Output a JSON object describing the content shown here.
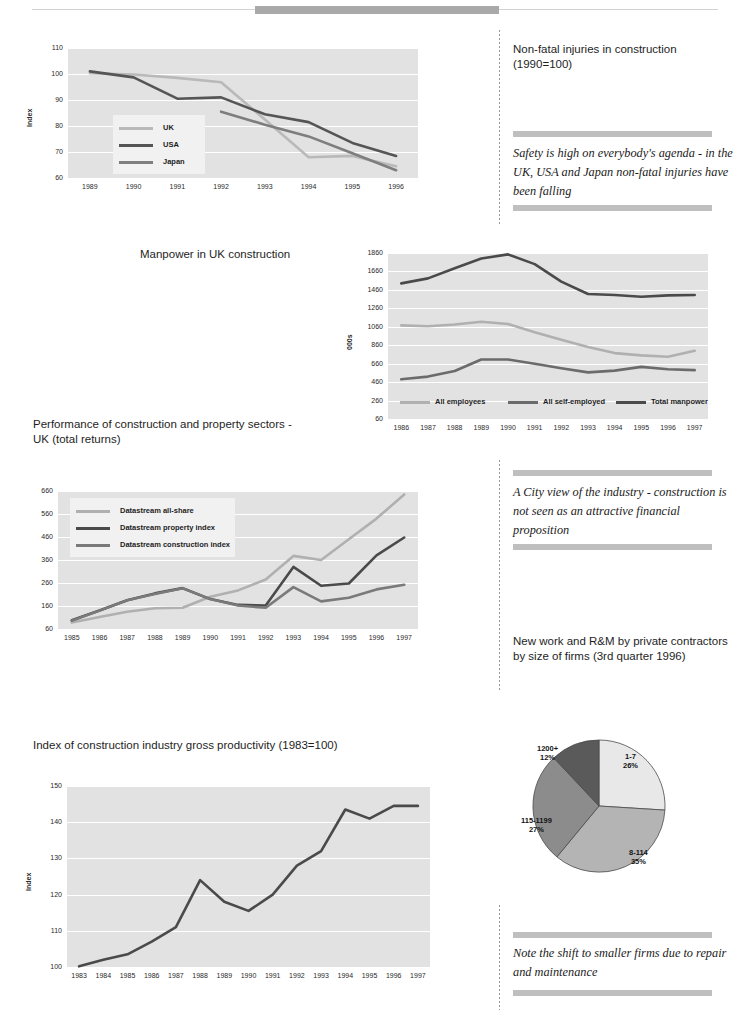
{
  "top_bar": {
    "accent_color": "#a9a9a9",
    "rule_color": "#d3d3d3"
  },
  "palette": {
    "light": "#b9b9b9",
    "mid": "#8c8c8c",
    "dark": "#555555",
    "darkest": "#3f3f3f",
    "plot_bg": "#e2e2e2",
    "bar_gray": "#bfbfbf"
  },
  "sidebar": {
    "block1": {
      "title": "Non-fatal injuries in construction (1990=100)",
      "quote": "Safety is high on everybody's agenda - in the UK, USA and Japan non-fatal injuries have been falling"
    },
    "block2": {
      "quote": "A City view of the industry - construction is not seen as an attractive financial proposition",
      "title": "New work and R&M by private contractors by size of firms (3rd quarter 1996)"
    },
    "block3": {
      "quote": "Note the shift to smaller firms due to repair and maintenance"
    }
  },
  "titles": {
    "manpower": "Manpower in UK construction",
    "performance": "Performance of construction and property sectors - UK (total returns)",
    "productivity": "Index of construction industry gross productivity (1983=100)"
  },
  "chart_data": [
    {
      "id": "injuries",
      "type": "line",
      "title": "Non-fatal injuries in construction (1990=100)",
      "xlabel": "",
      "ylabel": "Index",
      "x": [
        "1989",
        "1990",
        "1991",
        "1992",
        "1993",
        "1994",
        "1995",
        "1996"
      ],
      "ylim": [
        60,
        110
      ],
      "yticks": [
        60,
        70,
        80,
        90,
        100,
        110
      ],
      "grid": true,
      "legend": "inside-left",
      "series": [
        {
          "name": "UK",
          "color": "#b9b9b9",
          "values": [
            100.3,
            99.8,
            98.5,
            96.8,
            82.5,
            68.0,
            68.5,
            64.5
          ]
        },
        {
          "name": "USA",
          "color": "#555555",
          "values": [
            101.0,
            98.7,
            90.5,
            91.0,
            84.5,
            81.5,
            73.5,
            68.5
          ]
        },
        {
          "name": "Japan",
          "color": "#7e7e7e",
          "values": [
            null,
            null,
            null,
            85.5,
            80.5,
            76.0,
            69.5,
            63.0
          ]
        }
      ]
    },
    {
      "id": "manpower",
      "type": "line",
      "title": "Manpower in UK construction",
      "xlabel": "",
      "ylabel": "000s",
      "x": [
        "1986",
        "1987",
        "1988",
        "1989",
        "1990",
        "1991",
        "1992",
        "1993",
        "1994",
        "1995",
        "1996",
        "1997"
      ],
      "ylim": [
        60,
        1860
      ],
      "yticks": [
        60,
        260,
        460,
        660,
        860,
        1060,
        1260,
        1460,
        1660,
        1860
      ],
      "grid": true,
      "legend": "inside-bottom",
      "series": [
        {
          "name": "All employees",
          "color": "#b0b0b0",
          "values": [
            1075,
            1065,
            1085,
            1115,
            1090,
            1000,
            920,
            840,
            775,
            750,
            735,
            800
          ]
        },
        {
          "name": "All self-employed",
          "color": "#6b6b6b",
          "values": [
            490,
            520,
            580,
            705,
            705,
            660,
            610,
            565,
            585,
            625,
            600,
            590
          ]
        },
        {
          "name": "Total manpower",
          "color": "#4a4a4a",
          "values": [
            1530,
            1585,
            1695,
            1800,
            1845,
            1740,
            1550,
            1415,
            1405,
            1385,
            1400,
            1405
          ]
        }
      ]
    },
    {
      "id": "performance",
      "type": "line",
      "title": "Performance of construction and property sectors - UK (total returns)",
      "xlabel": "",
      "ylabel": "",
      "x": [
        "1985",
        "1986",
        "1987",
        "1988",
        "1989",
        "1990",
        "1991",
        "1992",
        "1993",
        "1994",
        "1995",
        "1996",
        "1997"
      ],
      "ylim": [
        60,
        660
      ],
      "yticks": [
        60,
        160,
        260,
        360,
        460,
        560,
        660
      ],
      "grid": true,
      "legend": "inside-top-left",
      "series": [
        {
          "name": "Datastream all-share",
          "color": "#b0b0b0",
          "values": [
            88,
            112,
            135,
            150,
            152,
            200,
            228,
            275,
            378,
            360,
            450,
            540,
            645
          ]
        },
        {
          "name": "Datastream property index",
          "color": "#4a4a4a",
          "values": [
            98,
            140,
            185,
            215,
            238,
            190,
            165,
            162,
            330,
            248,
            258,
            380,
            458
          ]
        },
        {
          "name": "Datastream construction index",
          "color": "#7a7a7a",
          "values": [
            96,
            140,
            185,
            212,
            237,
            190,
            162,
            152,
            242,
            180,
            196,
            232,
            252
          ]
        }
      ]
    },
    {
      "id": "productivity",
      "type": "line",
      "title": "Index of construction industry gross productivity (1983=100)",
      "xlabel": "",
      "ylabel": "Index",
      "x": [
        "1983",
        "1984",
        "1985",
        "1986",
        "1987",
        "1988",
        "1989",
        "1990",
        "1991",
        "1992",
        "1993",
        "1994",
        "1995",
        "1996",
        "1997"
      ],
      "ylim": [
        100,
        150
      ],
      "yticks": [
        100,
        110,
        120,
        130,
        140,
        150
      ],
      "grid": true,
      "legend": "none",
      "series": [
        {
          "name": "Index",
          "color": "#4a4a4a",
          "values": [
            100.2,
            102.0,
            103.5,
            107.0,
            111.0,
            124.0,
            118.0,
            115.5,
            120.0,
            128.0,
            132.0,
            143.5,
            141.0,
            144.5,
            144.5
          ]
        }
      ]
    },
    {
      "id": "firm-size-pie",
      "type": "pie",
      "title": "New work and R&M by private contractors by size of firms (3rd quarter 1996)",
      "labels": [
        "1-7",
        "8-114",
        "115-1199",
        "1200+"
      ],
      "values": [
        26,
        35,
        27,
        12
      ],
      "value_suffix": "%",
      "colors": [
        "#e8e8e8",
        "#b4b4b4",
        "#8c8c8c",
        "#5a5a5a"
      ]
    }
  ]
}
